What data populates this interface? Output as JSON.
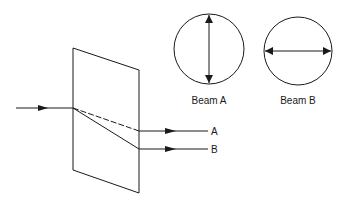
{
  "diagram": {
    "type": "birefringence / polarization splitting",
    "incident_beam": {
      "label": ""
    },
    "output_beams": [
      {
        "id": "A",
        "label": "A",
        "style": "dashed"
      },
      {
        "id": "B",
        "label": "B",
        "style": "solid"
      }
    ],
    "polarization_views": [
      {
        "label": "Beam A",
        "orientation": "vertical"
      },
      {
        "label": "Beam B",
        "orientation": "horizontal"
      }
    ],
    "colors": {
      "stroke": "#1a1a1a",
      "background": "#ffffff"
    }
  }
}
